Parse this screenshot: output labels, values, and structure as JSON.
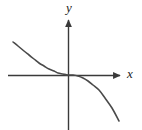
{
  "figure": {
    "title": "",
    "background_color": "#ffffff",
    "width": 142,
    "height": 130
  },
  "axes": {
    "x_axis": {
      "label": "x",
      "label_style": "italic",
      "color": "#3a3a3a",
      "arrow": "right",
      "y_pixel": 75,
      "start_x_pixel": 8,
      "end_x_pixel": 122
    },
    "y_axis": {
      "label": "y",
      "label_style": "italic",
      "color": "#3a3a3a",
      "arrow": "up",
      "x_pixel": 68,
      "start_y_pixel": 18,
      "end_y_pixel": 130
    },
    "origin": {
      "x_pixel": 68,
      "y_pixel": 75
    }
  },
  "chart_data": {
    "type": "line",
    "title": "",
    "xlabel": "x",
    "ylabel": "y",
    "grid": false,
    "legend": null,
    "xlim": [
      -2.2,
      1.8
    ],
    "ylim": [
      -1.6,
      1.3
    ],
    "series": [
      {
        "name": "y = -x^3",
        "color": "#4a4a4a",
        "line_width": 1.6,
        "x": [
          -2.2,
          -2.0,
          -1.8,
          -1.6,
          -1.4,
          -1.2,
          -1.0,
          -0.8,
          -0.6,
          -0.4,
          -0.2,
          0.0,
          0.2,
          0.4,
          0.6,
          0.8,
          1.0,
          1.2,
          1.4,
          1.6,
          1.75
        ],
        "y": [
          1.2,
          1.05,
          0.88,
          0.7,
          0.52,
          0.36,
          0.22,
          0.12,
          0.05,
          0.02,
          0.0,
          0.0,
          0.0,
          -0.02,
          -0.05,
          -0.12,
          -0.22,
          -0.36,
          -0.58,
          -0.92,
          -1.28
        ],
        "pixel_points": [
          [
            13,
            42
          ],
          [
            18,
            46
          ],
          [
            24,
            51
          ],
          [
            29,
            55
          ],
          [
            34,
            59
          ],
          [
            39,
            63
          ],
          [
            44,
            66
          ],
          [
            49,
            69
          ],
          [
            54,
            71
          ],
          [
            58,
            73
          ],
          [
            63,
            74
          ],
          [
            68,
            75
          ],
          [
            73,
            75
          ],
          [
            78,
            76
          ],
          [
            83,
            78
          ],
          [
            88,
            81
          ],
          [
            93,
            85
          ],
          [
            99,
            90
          ],
          [
            105,
            98
          ],
          [
            112,
            108
          ],
          [
            119,
            121
          ]
        ]
      }
    ]
  }
}
